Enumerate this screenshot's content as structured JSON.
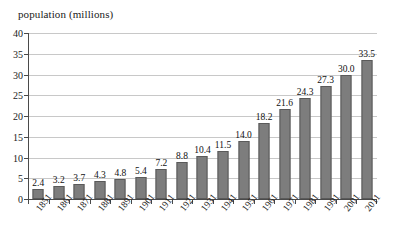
{
  "chart_data": {
    "type": "bar",
    "title": "population (millions)",
    "xlabel": "",
    "ylabel": "population (millions)",
    "categories": [
      "1851",
      "1861",
      "1871",
      "1881",
      "1891",
      "1901",
      "1911",
      "1921",
      "1931",
      "1941",
      "1951",
      "1961",
      "1971",
      "1981",
      "1991",
      "2001",
      "2011"
    ],
    "values": [
      2.4,
      3.2,
      3.7,
      4.3,
      4.8,
      5.4,
      7.2,
      8.8,
      10.4,
      11.5,
      14.0,
      18.2,
      21.6,
      24.3,
      27.3,
      30.0,
      33.5
    ],
    "value_labels": [
      "2.4",
      "3.2",
      "3.7",
      "4.3",
      "4.8",
      "5.4",
      "7.2",
      "8.8",
      "10.4",
      "11.5",
      "14.0",
      "18.2",
      "21.6",
      "24.3",
      "27.3",
      "30.0",
      "33.5"
    ],
    "ylim": [
      0,
      40
    ],
    "yticks": [
      0,
      5,
      10,
      15,
      20,
      25,
      30,
      35,
      40
    ],
    "ytick_labels": [
      "0",
      "5",
      "10",
      "15",
      "20",
      "25",
      "30",
      "35",
      "40"
    ],
    "grid": true,
    "legend": "none",
    "bar_color": "#7d7d7d",
    "bar_edge_color": "#5a5a5a",
    "gridline_color": "#c8c8c8",
    "axis_color": "#4a4a4a",
    "background_color": "#ffffff"
  }
}
